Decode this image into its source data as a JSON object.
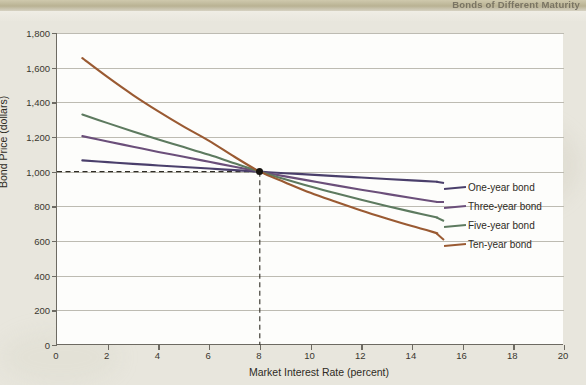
{
  "page": {
    "header_text": "Bonds of Different Maturity",
    "background_color": "#e8e6dd",
    "plot_background_color": "#fdfdfb"
  },
  "chart_data": {
    "type": "line",
    "title": "",
    "xlabel": "Market Interest Rate (percent)",
    "ylabel": "Bond Price (dollars)",
    "xlim": [
      0,
      20
    ],
    "ylim": [
      0,
      1800
    ],
    "xticks": [
      0,
      2,
      4,
      6,
      8,
      10,
      12,
      14,
      16,
      18,
      20
    ],
    "xtick_labels": [
      "0",
      "2",
      "4",
      "6",
      "8",
      "10",
      "12",
      "14",
      "16",
      "18",
      "20"
    ],
    "yticks": [
      0,
      200,
      400,
      600,
      800,
      1000,
      1200,
      1400,
      1600,
      1800
    ],
    "ytick_labels": [
      "0",
      "200",
      "400",
      "600",
      "800",
      "1,000",
      "1,200",
      "1,400",
      "1,600",
      "1,800"
    ],
    "grid": "horizontal",
    "legend_position": "right",
    "x": [
      1,
      2,
      3,
      4,
      5,
      6,
      7,
      8,
      9,
      10,
      11,
      12,
      13,
      14,
      15
    ],
    "series": [
      {
        "name": "One-year bond",
        "color": "#4a3f6b",
        "values": [
          1065,
          1055,
          1045,
          1036,
          1027,
          1018,
          1009,
          1000,
          991,
          983,
          974,
          966,
          958,
          950,
          942
        ]
      },
      {
        "name": "Three-year bond",
        "color": "#6b4f7a",
        "values": [
          1205,
          1174,
          1144,
          1114,
          1086,
          1057,
          1028,
          1000,
          973,
          947,
          921,
          896,
          872,
          848,
          825
        ]
      },
      {
        "name": "Five-year bond",
        "color": "#5d7a5f",
        "values": [
          1330,
          1280,
          1232,
          1186,
          1142,
          1097,
          1048,
          1000,
          956,
          914,
          875,
          838,
          802,
          768,
          736
        ]
      },
      {
        "name": "Ten-year bond",
        "color": "#9a5a32",
        "values": [
          1655,
          1545,
          1442,
          1348,
          1260,
          1178,
          1086,
          1000,
          938,
          878,
          826,
          776,
          730,
          686,
          645
        ]
      }
    ],
    "annotations": [
      {
        "type": "intersection-point",
        "x": 8,
        "y": 1000,
        "label": "",
        "guide_lines": "dashed"
      }
    ]
  },
  "legend": {
    "items": [
      {
        "label": "One-year bond",
        "color": "#4a3f6b"
      },
      {
        "label": "Three-year bond",
        "color": "#6b4f7a"
      },
      {
        "label": "Five-year bond",
        "color": "#5d7a5f"
      },
      {
        "label": "Ten-year bond",
        "color": "#9a5a32"
      }
    ]
  }
}
